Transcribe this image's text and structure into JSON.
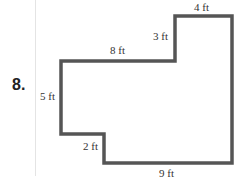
{
  "problem": {
    "number": "8."
  },
  "shape": {
    "stroke_color": "#555555",
    "labels": {
      "top": "4 ft",
      "upper_step": "3 ft",
      "middle_top": "8 ft",
      "left": "5 ft",
      "lower_step": "2 ft",
      "bottom": "9 ft"
    }
  }
}
